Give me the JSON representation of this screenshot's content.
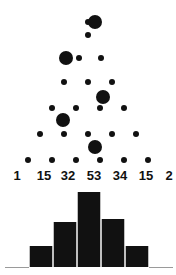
{
  "figure": {
    "type": "galton-board-binomial-figure",
    "width": 176,
    "height": 275,
    "background_color": "#ffffff",
    "ink_color": "#111111",
    "axis_color": "#9a9a9a"
  },
  "labels": {
    "bin_counts": [
      "1",
      "15",
      "32",
      "53",
      "34",
      "15",
      "2"
    ],
    "bin_label_x": [
      17,
      44,
      68,
      94,
      120,
      146,
      169
    ],
    "font_size_px": 13,
    "bold": true
  },
  "board": {
    "peg_rows": [
      {
        "y": 22,
        "xs": [
          88
        ],
        "r": 3
      },
      {
        "y": 35,
        "xs": [],
        "r": 3
      },
      {
        "y": 58,
        "xs": [
          79,
          101
        ],
        "r": 3
      },
      {
        "y": 82,
        "xs": [
          64,
          88,
          112
        ],
        "r": 3
      },
      {
        "y": 108,
        "xs": [
          52,
          76,
          100,
          124
        ],
        "r": 3
      },
      {
        "y": 134,
        "xs": [
          40,
          64,
          88,
          112,
          136
        ],
        "r": 3
      },
      {
        "y": 160,
        "xs": [
          28,
          52,
          76,
          100,
          124,
          148
        ],
        "r": 3
      }
    ],
    "balls": [
      {
        "x": 95,
        "y": 22,
        "r": 7
      },
      {
        "x": 66,
        "y": 58,
        "r": 7
      },
      {
        "x": 103,
        "y": 97,
        "r": 7
      },
      {
        "x": 63,
        "y": 120,
        "r": 7
      },
      {
        "x": 95,
        "y": 147,
        "r": 7
      }
    ]
  },
  "chart_data": {
    "type": "bar",
    "title": "",
    "xlabel": "",
    "ylabel": "",
    "categories": [
      "1",
      "2",
      "3",
      "4",
      "5",
      "6",
      "7"
    ],
    "values": [
      1,
      15,
      32,
      53,
      34,
      15,
      2
    ],
    "ylim": [
      0,
      53
    ],
    "grid": false,
    "legend": false,
    "bars": [
      {
        "label": "1",
        "value": 1,
        "x": 5,
        "width": 24,
        "height": 1,
        "rendered": "baseline"
      },
      {
        "label": "15",
        "value": 15,
        "x": 29,
        "width": 24,
        "height": 21,
        "rendered": "bar"
      },
      {
        "label": "32",
        "value": 32,
        "x": 53,
        "width": 24,
        "height": 45,
        "rendered": "bar"
      },
      {
        "label": "53",
        "value": 53,
        "x": 77,
        "width": 24,
        "height": 75,
        "rendered": "bar"
      },
      {
        "label": "34",
        "value": 34,
        "x": 101,
        "width": 24,
        "height": 48,
        "rendered": "bar"
      },
      {
        "label": "15",
        "value": 15,
        "x": 125,
        "width": 24,
        "height": 21,
        "rendered": "bar"
      },
      {
        "label": "2",
        "value": 2,
        "x": 149,
        "width": 24,
        "height": 1,
        "rendered": "baseline"
      }
    ]
  }
}
